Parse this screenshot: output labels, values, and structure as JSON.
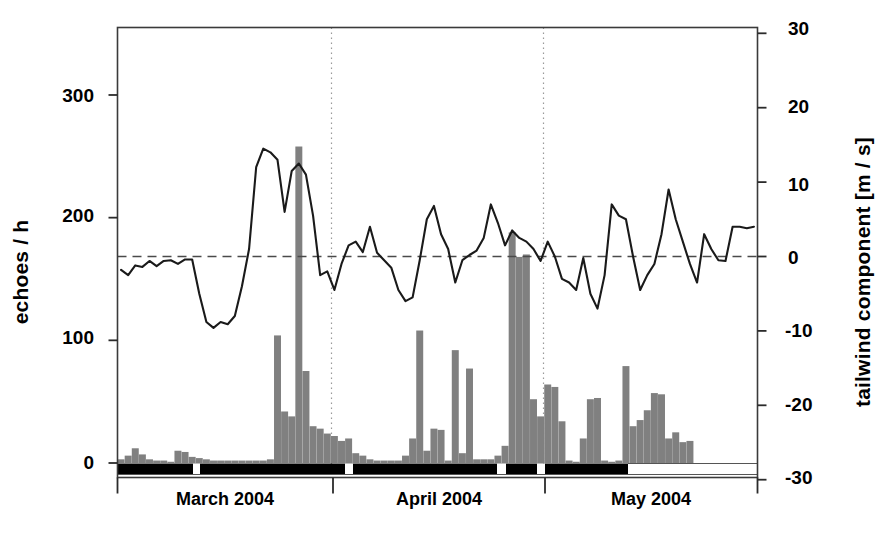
{
  "figure": {
    "background": "#ffffff",
    "frame_color": "#3a3a3a",
    "bar_color": "#808080",
    "line_color": "#1a1a1a",
    "strip_color": "#000000"
  },
  "axes": {
    "left": {
      "title": "echoes / h",
      "ticks": [
        0,
        100,
        200,
        300
      ],
      "tick_labels": [
        "0",
        "100",
        "200",
        "300"
      ],
      "range": [
        0,
        350
      ]
    },
    "right": {
      "title": "tailwind component [m / s]",
      "ticks": [
        -30,
        -20,
        -10,
        0,
        10,
        20,
        30
      ],
      "tick_labels": [
        "-30",
        "-20",
        "-10",
        "0",
        "10",
        "20",
        "30"
      ],
      "range": [
        -32.5,
        30
      ]
    },
    "x": {
      "months": [
        "March 2004",
        "April 2004",
        "May 2004"
      ],
      "boundaries": [
        "2004-02-25",
        "2004-03-26",
        "2004-04-25",
        "2004-05-25"
      ],
      "gridlines": [
        "2004-03-24",
        "2004-04-23"
      ]
    }
  },
  "chart_data": {
    "type": "bar",
    "title": "",
    "xlabel": "",
    "ylabel": "echoes / h",
    "ylim": [
      0,
      350
    ],
    "y2lim": [
      -32.5,
      30
    ],
    "y2label": "tailwind component [m / s]",
    "grid": "vertical dotted at two dates",
    "legend": "none",
    "categories": [
      "d01",
      "d02",
      "d03",
      "d04",
      "d05",
      "d06",
      "d07",
      "d08",
      "d09",
      "d10",
      "d11",
      "d12",
      "d13",
      "d14",
      "d15",
      "d16",
      "d17",
      "d18",
      "d19",
      "d20",
      "d21",
      "d22",
      "d23",
      "d24",
      "d25",
      "d26",
      "d27",
      "d28",
      "d29",
      "d30",
      "d31",
      "d32",
      "d33",
      "d34",
      "d35",
      "d36",
      "d37",
      "d38",
      "d39",
      "d40",
      "d41",
      "d42",
      "d43",
      "d44",
      "d45",
      "d46",
      "d47",
      "d48",
      "d49",
      "d50",
      "d51",
      "d52",
      "d53",
      "d54",
      "d55",
      "d56",
      "d57",
      "d58",
      "d59",
      "d60",
      "d61",
      "d62",
      "d63",
      "d64",
      "d65",
      "d66",
      "d67",
      "d68",
      "d69",
      "d70",
      "d71",
      "d72",
      "d73",
      "d74",
      "d75",
      "d76",
      "d77",
      "d78",
      "d79",
      "d80",
      "d81",
      "d82",
      "d83",
      "d84",
      "d85",
      "d86",
      "d87",
      "d88",
      "d89",
      "d90"
    ],
    "series": [
      {
        "name": "echoes / h",
        "type": "bar",
        "axis": "left",
        "color": "#808080",
        "values": [
          3,
          6,
          12,
          7,
          3,
          2,
          2,
          1,
          10,
          9,
          5,
          4,
          3,
          2,
          2,
          2,
          2,
          2,
          2,
          2,
          2,
          3,
          104,
          42,
          38,
          258,
          75,
          30,
          28,
          24,
          22,
          18,
          20,
          8,
          6,
          3,
          2,
          2,
          2,
          2,
          6,
          20,
          108,
          10,
          28,
          27,
          2,
          92,
          8,
          77,
          3,
          3,
          3,
          6,
          14,
          188,
          168,
          170,
          52,
          38,
          64,
          62,
          34,
          2,
          1,
          20,
          52,
          53,
          2,
          1,
          2,
          79,
          30,
          35,
          43,
          57,
          56,
          20,
          25,
          17,
          18,
          0,
          0,
          0,
          0,
          0,
          0,
          0,
          0,
          0
        ]
      },
      {
        "name": "tailwind component",
        "type": "line",
        "axis": "right",
        "color": "#1a1a1a",
        "values": [
          -1.8,
          -2.5,
          -1.2,
          -1.4,
          -0.6,
          -1.3,
          -0.6,
          -0.5,
          -1.0,
          -0.4,
          -0.4,
          -5.0,
          -8.8,
          -9.6,
          -8.8,
          -9.1,
          -8.0,
          -4.0,
          1.0,
          12.0,
          14.5,
          14.0,
          13.0,
          6.0,
          11.5,
          12.5,
          11.0,
          5.5,
          -2.5,
          -2.0,
          -4.5,
          -1.0,
          1.5,
          2.0,
          0.6,
          4.0,
          0.5,
          -0.5,
          -1.5,
          -4.5,
          -6.0,
          -5.5,
          -0.5,
          5.0,
          6.8,
          3.0,
          1.0,
          -3.5,
          -0.5,
          0.2,
          0.8,
          2.5,
          7.0,
          4.5,
          1.5,
          3.5,
          2.5,
          2.0,
          1.0,
          -0.6,
          2.0,
          0.0,
          -3.0,
          -3.5,
          -4.5,
          -0.2,
          -5.0,
          -7.0,
          -2.5,
          7.0,
          5.5,
          5.0,
          0.0,
          -4.5,
          -2.5,
          -1.0,
          3.0,
          9.0,
          5.0,
          2.0,
          -1.0,
          -3.5,
          3.0,
          1.0,
          -0.5,
          -0.6,
          4.0,
          4.0,
          3.8,
          4.0
        ]
      }
    ],
    "reference_line": {
      "axis": "right",
      "value": 0,
      "style": "dashed"
    },
    "annotation_strip": {
      "description": "black horizontal observation-coverage strip below zero with white gaps",
      "color": "#000000"
    }
  }
}
